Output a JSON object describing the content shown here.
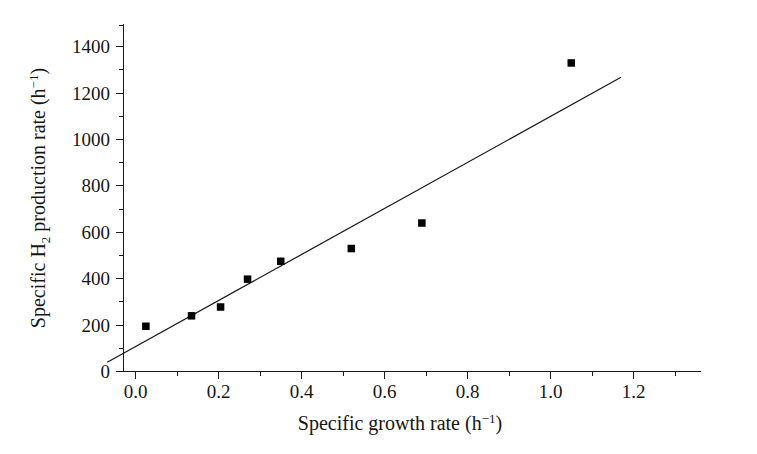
{
  "figure": {
    "background_color": "#ffffff",
    "foreground_color": "#1a1a1a"
  },
  "axes": {
    "x": {
      "title_main": "Specific growth rate (h",
      "title_sup": "−1",
      "title_close": ")",
      "title_full": "Specific growth rate (h−1)",
      "ticklabels": [
        "0.0",
        "0.2",
        "0.4",
        "0.6",
        "0.8",
        "1.0",
        "1.2"
      ],
      "tickvalues": [
        0.0,
        0.2,
        0.4,
        0.6,
        0.8,
        1.0,
        1.2
      ],
      "min": -0.085,
      "max": 1.31
    },
    "y": {
      "title_pre": "Specific H",
      "title_sub": "2",
      "title_mid": " production rate (h",
      "title_sup": "−1",
      "title_close": ")",
      "title_full": "Specific H2 production rate (h−1)",
      "ticklabels": [
        "0",
        "200",
        "400",
        "600",
        "800",
        "1000",
        "1200",
        "1400"
      ],
      "tickvalues": [
        0,
        200,
        400,
        600,
        800,
        1000,
        1200,
        1400
      ],
      "minor_tickvalues": [
        100,
        300,
        500,
        700,
        900,
        1100,
        1300,
        1500
      ],
      "min": 0,
      "max": 1500
    }
  },
  "chart_data": {
    "type": "scatter",
    "title": "",
    "xlabel": "Specific growth rate (h−1)",
    "ylabel": "Specific H2 production rate (h−1)",
    "xlim": [
      -0.085,
      1.31
    ],
    "ylim": [
      0,
      1500
    ],
    "grid": false,
    "legend": "none",
    "marker": "filled-square",
    "marker_color": "#000000",
    "series": [
      {
        "name": "measured",
        "x": [
          0.025,
          0.135,
          0.205,
          0.27,
          0.35,
          0.52,
          0.69,
          1.05
        ],
        "y": [
          195,
          240,
          278,
          398,
          475,
          530,
          640,
          1330
        ]
      }
    ],
    "trendline": {
      "type": "line",
      "color": "#1a1a1a",
      "x": [
        -0.068,
        1.17
      ],
      "y": [
        40,
        1268
      ]
    }
  }
}
